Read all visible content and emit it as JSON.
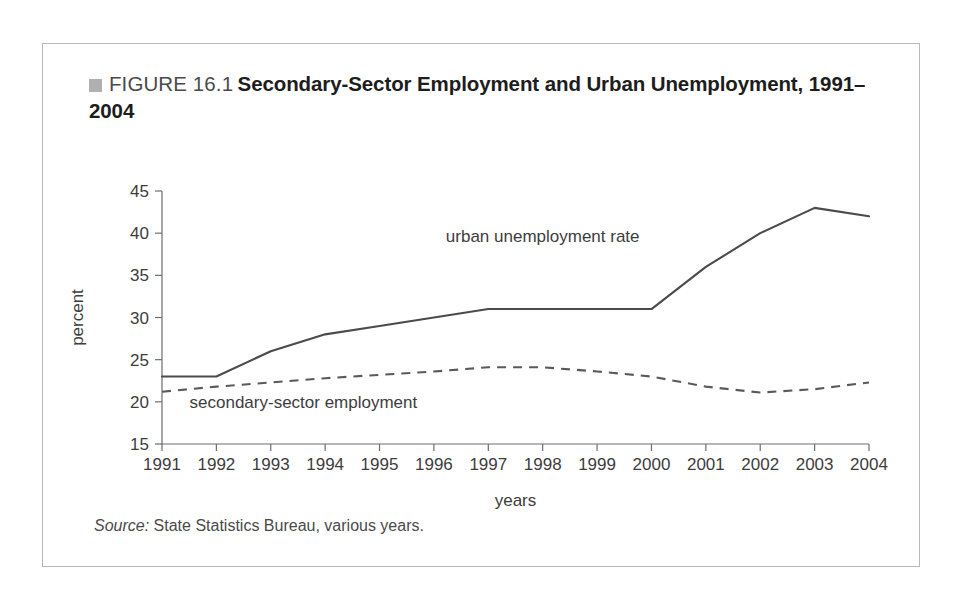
{
  "figure": {
    "marker_icon": "gray-square-icon",
    "number": "FIGURE 16.1",
    "title": "Secondary-Sector Employment and Urban Unemployment, 1991–2004",
    "source_lead": "Source:",
    "source_text": "State Statistics Bureau, various years."
  },
  "colors": {
    "frame_border": "#b9b9b9",
    "marker": "#b0b0b0",
    "axis": "#6e6e6e",
    "solid_series": "#4b4b4b",
    "dashed_series": "#5a5a5a",
    "text": "#3d3d3d",
    "title_text": "#1d1d1d"
  },
  "chart_data": {
    "type": "line",
    "title": "Secondary-Sector Employment and Urban Unemployment, 1991–2004",
    "xlabel": "years",
    "ylabel": "percent",
    "categories": [
      "1991",
      "1992",
      "1993",
      "1994",
      "1995",
      "1996",
      "1997",
      "1998",
      "1999",
      "2000",
      "2001",
      "2002",
      "2003",
      "2004"
    ],
    "x": [
      1991,
      1992,
      1993,
      1994,
      1995,
      1996,
      1997,
      1998,
      1999,
      2000,
      2001,
      2002,
      2003,
      2004
    ],
    "ylim": [
      15,
      45
    ],
    "xlim": [
      1991,
      2004
    ],
    "yticks": [
      15,
      20,
      25,
      30,
      35,
      40,
      45
    ],
    "ytick_labels": [
      "15",
      "20",
      "25",
      "30",
      "35",
      "40",
      "45"
    ],
    "grid": false,
    "legend": "inline-annotations",
    "series": [
      {
        "name": "urban unemployment rate",
        "style": "solid",
        "label_position": "above-line-center-right",
        "values": [
          23.0,
          23.0,
          26.0,
          28.0,
          29.0,
          30.0,
          31.0,
          31.0,
          31.0,
          31.0,
          36.0,
          40.0,
          43.0,
          42.0
        ]
      },
      {
        "name": "secondary-sector employment",
        "style": "dashed",
        "label_position": "below-line-left",
        "values": [
          21.2,
          21.8,
          22.3,
          22.8,
          23.2,
          23.6,
          24.1,
          24.1,
          23.6,
          23.0,
          21.8,
          21.1,
          21.5,
          22.3
        ]
      }
    ],
    "annotations": [
      {
        "text": "urban unemployment rate",
        "x": 1998.0,
        "y": 39.0
      },
      {
        "text": "secondary-sector employment",
        "x": 1993.6,
        "y": 19.3
      }
    ]
  }
}
